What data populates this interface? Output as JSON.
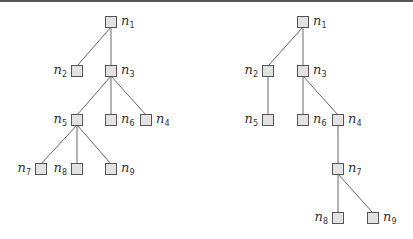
{
  "trees": [
    {
      "name": "left-tree",
      "nodes": [
        {
          "id": "n1",
          "label": "n",
          "sub": "1",
          "x": 111,
          "y": 22,
          "side": "right"
        },
        {
          "id": "n2",
          "label": "n",
          "sub": "2",
          "x": 77,
          "y": 71,
          "side": "left"
        },
        {
          "id": "n3",
          "label": "n",
          "sub": "3",
          "x": 111,
          "y": 71,
          "side": "right"
        },
        {
          "id": "n5",
          "label": "n",
          "sub": "5",
          "x": 77,
          "y": 120,
          "side": "left"
        },
        {
          "id": "n6",
          "label": "n",
          "sub": "6",
          "x": 111,
          "y": 120,
          "side": "right"
        },
        {
          "id": "n4",
          "label": "n",
          "sub": "4",
          "x": 146,
          "y": 120,
          "side": "right"
        },
        {
          "id": "n7",
          "label": "n",
          "sub": "7",
          "x": 41,
          "y": 169,
          "side": "left"
        },
        {
          "id": "n8",
          "label": "n",
          "sub": "8",
          "x": 77,
          "y": 169,
          "side": "left"
        },
        {
          "id": "n9",
          "label": "n",
          "sub": "9",
          "x": 111,
          "y": 169,
          "side": "right"
        }
      ],
      "edges": [
        [
          "n1",
          "n2"
        ],
        [
          "n1",
          "n3"
        ],
        [
          "n3",
          "n5"
        ],
        [
          "n3",
          "n6"
        ],
        [
          "n3",
          "n4"
        ],
        [
          "n5",
          "n7"
        ],
        [
          "n5",
          "n8"
        ],
        [
          "n5",
          "n9"
        ]
      ]
    },
    {
      "name": "right-tree",
      "nodes": [
        {
          "id": "n1",
          "label": "n",
          "sub": "1",
          "x": 303,
          "y": 22,
          "side": "right"
        },
        {
          "id": "n2",
          "label": "n",
          "sub": "2",
          "x": 268,
          "y": 71,
          "side": "left"
        },
        {
          "id": "n3",
          "label": "n",
          "sub": "3",
          "x": 303,
          "y": 71,
          "side": "right"
        },
        {
          "id": "n5",
          "label": "n",
          "sub": "5",
          "x": 268,
          "y": 120,
          "side": "left"
        },
        {
          "id": "n6",
          "label": "n",
          "sub": "6",
          "x": 303,
          "y": 120,
          "side": "right"
        },
        {
          "id": "n4",
          "label": "n",
          "sub": "4",
          "x": 338,
          "y": 120,
          "side": "right"
        },
        {
          "id": "n7",
          "label": "n",
          "sub": "7",
          "x": 338,
          "y": 169,
          "side": "right"
        },
        {
          "id": "n8",
          "label": "n",
          "sub": "8",
          "x": 338,
          "y": 218,
          "side": "left"
        },
        {
          "id": "n9",
          "label": "n",
          "sub": "9",
          "x": 373,
          "y": 218,
          "side": "right"
        }
      ],
      "edges": [
        [
          "n1",
          "n2"
        ],
        [
          "n1",
          "n3"
        ],
        [
          "n2",
          "n5"
        ],
        [
          "n3",
          "n6"
        ],
        [
          "n3",
          "n4"
        ],
        [
          "n4",
          "n7"
        ],
        [
          "n7",
          "n8"
        ],
        [
          "n7",
          "n9"
        ]
      ]
    }
  ],
  "colors": {
    "node_fill": "#e2e2e2",
    "node_stroke": "#555555",
    "edge": "#666666",
    "label": "#333333"
  }
}
